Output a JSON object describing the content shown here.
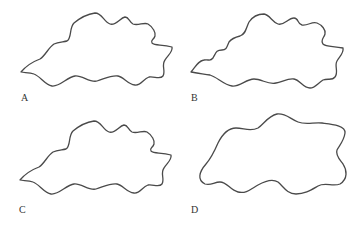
{
  "figure": {
    "panels": [
      {
        "label": "A",
        "description": "wavy irregular leaf-like outline with pointed left tip"
      },
      {
        "label": "B",
        "description": "wavy irregular outline with more undulations along upper-left edge"
      },
      {
        "label": "C",
        "description": "wavy irregular outline similar to A"
      },
      {
        "label": "D",
        "description": "smoother rounded blob-like outline with gentle undulations"
      }
    ],
    "stroke_color": "#4a4a4a",
    "background": "#ffffff"
  }
}
